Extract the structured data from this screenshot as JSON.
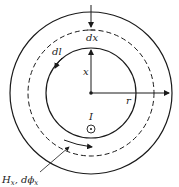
{
  "diagram": {
    "type": "toroidal-core-cross-section",
    "labels": {
      "dx": "dx",
      "dl": "dl",
      "x": "x",
      "r": "r",
      "current": "I",
      "field": "H",
      "field_sub": "x",
      "flux": ", dϕ",
      "flux_sub": "x"
    },
    "geometry": {
      "center": [
        91,
        93
      ],
      "outer_radius": 81,
      "dashed_radius": 63,
      "inner_radius": 45
    },
    "colors": {
      "stroke": "#1a1a1a",
      "background": "#ffffff"
    },
    "icons": [
      "current-out-of-page-icon",
      "arrow-icon"
    ]
  }
}
